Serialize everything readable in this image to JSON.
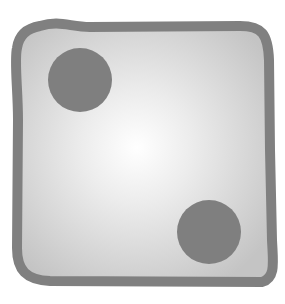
{
  "illustration": {
    "subject": "die face",
    "face_value": 2,
    "pips": [
      {
        "cx": 80,
        "cy": 80,
        "r": 32
      },
      {
        "cx": 209,
        "cy": 232,
        "r": 32
      }
    ],
    "colors": {
      "background": "#ffffff",
      "border": "#808080",
      "face_center": "#ffffff",
      "face_edge": "#c6c6c6",
      "pip": "#7f7f7f"
    }
  }
}
